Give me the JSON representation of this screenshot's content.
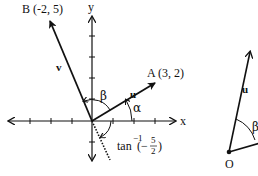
{
  "left_diagram": {
    "axes": {
      "x_label": "x",
      "y_label": "y"
    },
    "point_b": {
      "label": "B (-2, 5)"
    },
    "point_a": {
      "label": "A (3, 2)"
    },
    "vector_v": {
      "label": "v"
    },
    "vector_u": {
      "label": "u"
    },
    "angle_alpha": {
      "label": "α"
    },
    "angle_beta": {
      "label": "β"
    },
    "angle_tan": {
      "prefix": "tan",
      "superscript": "−1",
      "open": "(−",
      "num": "5",
      "den": "2",
      "close": ")"
    }
  },
  "right_diagram": {
    "origin": {
      "label": "O"
    },
    "vector_u": {
      "label": "u"
    },
    "angle_beta": {
      "label": "β"
    }
  }
}
